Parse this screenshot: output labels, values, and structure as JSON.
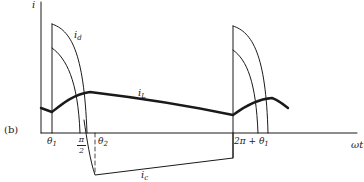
{
  "figure": {
    "panel_label": "(b)",
    "y_axis_label": "i",
    "x_axis_label": "ωt",
    "curves": {
      "i_d": {
        "name": "i",
        "sub": "d"
      },
      "i_L": {
        "name": "i",
        "sub": "L"
      },
      "i_c": {
        "name": "i",
        "sub": "c"
      }
    },
    "ticks": {
      "theta1": {
        "name": "θ",
        "sub": "1"
      },
      "pi_over_2": {
        "num": "π",
        "den": "2"
      },
      "theta2": {
        "name": "θ",
        "sub": "2"
      },
      "two_pi_plus_theta1": {
        "prefix": "2π + θ",
        "sub": "1"
      }
    },
    "colors": {
      "stroke": "#1a1a1a",
      "background": "#ffffff"
    }
  }
}
